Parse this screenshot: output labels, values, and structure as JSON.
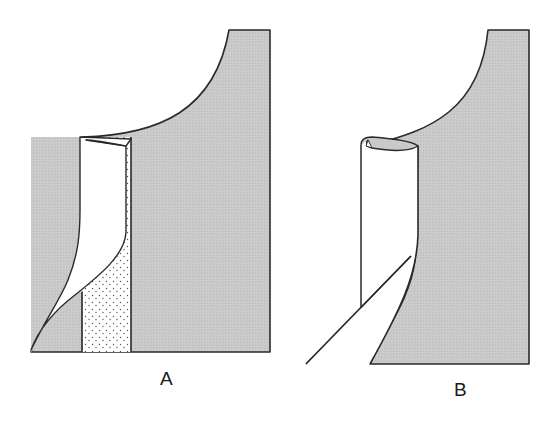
{
  "figure": {
    "panels": [
      {
        "id": "A",
        "label": "A",
        "description": "Garment neckline with facing partially turned; dotted interfacing strip visible"
      },
      {
        "id": "B",
        "label": "B",
        "description": "Facing rolled over at neckline edge, hem edge folded back diagonally"
      }
    ],
    "colors": {
      "fabric_gray": "#c8c8c8",
      "outline": "#2a2a2a",
      "facing_white": "#ffffff",
      "dots": "#555555"
    }
  }
}
